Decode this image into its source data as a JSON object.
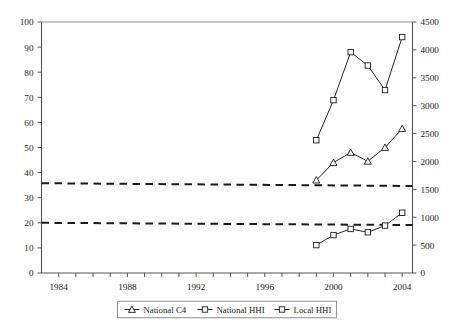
{
  "chart_data": {
    "type": "line",
    "title": "",
    "subtitle": "",
    "xlabel": "",
    "ylabel": "",
    "y2label": "",
    "grid": false,
    "legend_position": "bottom",
    "x": [
      1999,
      2000,
      2001,
      2002,
      2003,
      2004
    ],
    "xlim": [
      1983,
      2004.6
    ],
    "ylim": [
      0,
      100
    ],
    "y2lim": [
      0,
      4500
    ],
    "xticks": [
      1984,
      1985,
      1986,
      1987,
      1988,
      1989,
      1990,
      1991,
      1992,
      1993,
      1994,
      1995,
      1996,
      1997,
      1998,
      1999,
      2000,
      2001,
      2002,
      2003,
      2004
    ],
    "xticklabels_shown": [
      "1984",
      "1988",
      "1992",
      "1996",
      "2000",
      "2004"
    ],
    "xticklabel_years": [
      1984,
      1988,
      1992,
      1996,
      2000,
      2004
    ],
    "yticks": [
      0,
      10,
      20,
      30,
      40,
      50,
      60,
      70,
      80,
      90,
      100
    ],
    "yticklabels": [
      "0",
      "10",
      "20",
      "30",
      "40",
      "50",
      "60",
      "70",
      "80",
      "90",
      "100"
    ],
    "y2ticks": [
      0,
      500,
      1000,
      1500,
      2000,
      2500,
      3000,
      3500,
      4000,
      4500
    ],
    "y2ticklabels": [
      "0",
      "500",
      "1000",
      "1500",
      "2000",
      "2500",
      "3000",
      "3500",
      "4000",
      "4500"
    ],
    "series": [
      {
        "name": "National C4",
        "axis": "left",
        "marker": "triangle",
        "color": "#1a1a1a",
        "values": [
          37.0,
          44.0,
          48.0,
          44.5,
          50.0,
          57.5
        ]
      },
      {
        "name": "National HHI",
        "axis": "right",
        "marker": "square",
        "color": "#1a1a1a",
        "values": [
          2380,
          3100,
          3960,
          3720,
          3280,
          4230
        ]
      },
      {
        "name": "Local HHI",
        "axis": "right",
        "marker": "square",
        "color": "#1a1a1a",
        "values": [
          500,
          680,
          790,
          730,
          850,
          1080
        ]
      }
    ],
    "reference_lines": [
      {
        "name": "upper-threshold",
        "axis": "right",
        "style": "dashed",
        "color": "#1a1a1a",
        "start_value": 1610,
        "end_value": 1560
      },
      {
        "name": "lower-threshold",
        "axis": "right",
        "style": "dashed",
        "color": "#1a1a1a",
        "start_value": 900,
        "end_value": 860
      }
    ],
    "legend": [
      {
        "label": "National C4",
        "marker": "triangle"
      },
      {
        "label": "National HHI",
        "marker": "square"
      },
      {
        "label": "Local HHI",
        "marker": "square"
      }
    ]
  },
  "colors": {
    "ink": "#1a1a1a",
    "axis": "#555555",
    "background": "#ffffff"
  }
}
